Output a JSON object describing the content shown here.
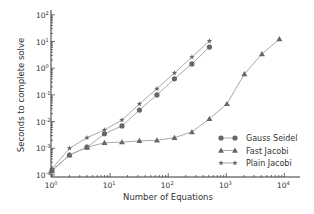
{
  "chart_data": {
    "type": "line",
    "title": "",
    "xlabel": "Number of Equations",
    "ylabel": "Seconds to complete solve",
    "xscale": "log",
    "yscale": "log",
    "xlim": [
      1,
      15000
    ],
    "ylim": [
      0.0001,
      100
    ],
    "grid": false,
    "legend_position": "lower right",
    "x_ticks": [
      {
        "value": 1,
        "base": "10",
        "exp": "0"
      },
      {
        "value": 10,
        "base": "10",
        "exp": "1"
      },
      {
        "value": 100,
        "base": "10",
        "exp": "2"
      },
      {
        "value": 1000,
        "base": "10",
        "exp": "3"
      },
      {
        "value": 10000,
        "base": "10",
        "exp": "4"
      }
    ],
    "y_ticks": [
      {
        "value": 0.0001,
        "base": "10",
        "exp": "-4"
      },
      {
        "value": 0.001,
        "base": "10",
        "exp": "-3"
      },
      {
        "value": 0.01,
        "base": "10",
        "exp": "-2"
      },
      {
        "value": 0.1,
        "base": "10",
        "exp": "-1"
      },
      {
        "value": 1,
        "base": "10",
        "exp": "0"
      },
      {
        "value": 10,
        "base": "10",
        "exp": "1"
      },
      {
        "value": 100,
        "base": "10",
        "exp": "2"
      }
    ],
    "series": [
      {
        "name": "Gauss Seidel",
        "marker": "circle",
        "x": [
          1,
          2,
          4,
          8,
          16,
          32,
          64,
          128,
          256,
          512
        ],
        "values": [
          0.00015,
          0.00056,
          0.0011,
          0.0035,
          0.0069,
          0.027,
          0.1,
          0.4,
          1.45,
          6.2
        ]
      },
      {
        "name": "Fast Jacobi",
        "marker": "triangle",
        "x": [
          1,
          2,
          4,
          8,
          16,
          32,
          64,
          128,
          256,
          512,
          1024,
          2048,
          4096,
          8192
        ],
        "values": [
          0.00014,
          0.00056,
          0.0011,
          0.0016,
          0.0017,
          0.0019,
          0.002,
          0.0025,
          0.0041,
          0.0126,
          0.046,
          0.6,
          3.4,
          12.3
        ]
      },
      {
        "name": "Plain Jacobi",
        "marker": "star",
        "x": [
          1,
          2,
          4,
          8,
          16,
          32,
          64,
          128,
          256,
          512
        ],
        "values": [
          0.00017,
          0.001,
          0.0025,
          0.0049,
          0.0115,
          0.046,
          0.17,
          0.66,
          2.6,
          10.5
        ]
      }
    ]
  },
  "colors": {
    "axis": "#333333",
    "line": "#aaaaaa",
    "marker": "#666666",
    "text": "#333333"
  }
}
